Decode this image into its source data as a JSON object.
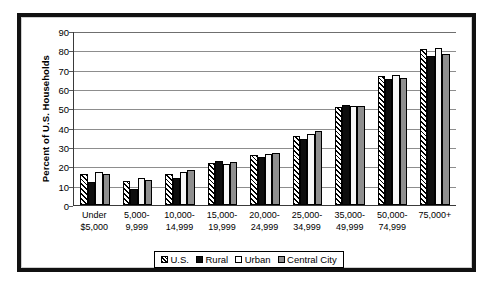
{
  "frame": {
    "border_color": "#111111",
    "background": "#ffffff"
  },
  "chart_data": {
    "type": "bar",
    "title": "",
    "xlabel": "",
    "ylabel": "Percent of U.S. Households",
    "ylim": [
      0,
      90
    ],
    "ytick_step": 10,
    "yticks": [
      "90",
      "80",
      "70",
      "60",
      "50",
      "40",
      "30",
      "20",
      "10",
      "0"
    ],
    "grid": true,
    "grid_axis": "y",
    "legend_position": "bottom-center",
    "categories": [
      "Under\n$5,000",
      "5,000-\n9,999",
      "10,000-\n14,999",
      "15,000-\n19,999",
      "20,000-\n24,999",
      "25,000-\n34,999",
      "35,000-\n49,999",
      "50,000-\n74,999",
      "75,000+"
    ],
    "category_lines": [
      [
        "Under",
        "$5,000"
      ],
      [
        "5,000-",
        "9,999"
      ],
      [
        "10,000-",
        "14,999"
      ],
      [
        "15,000-",
        "19,999"
      ],
      [
        "20,000-",
        "24,999"
      ],
      [
        "25,000-",
        "34,999"
      ],
      [
        "35,000-",
        "49,999"
      ],
      [
        "50,000-",
        "74,999"
      ],
      [
        "75,000+",
        ""
      ]
    ],
    "series": [
      {
        "name": "U.S.",
        "style": "diagonal-hatch",
        "color": "#ffffff",
        "values": [
          15.8,
          12.5,
          16.0,
          21.5,
          26.0,
          35.5,
          50.8,
          66.5,
          80.5
        ]
      },
      {
        "name": "Rural",
        "style": "solid-black",
        "color": "#0d0d0d",
        "values": [
          12.0,
          8.5,
          14.2,
          22.6,
          25.0,
          34.0,
          51.5,
          65.0,
          77.2
        ]
      },
      {
        "name": "Urban",
        "style": "solid-white",
        "color": "#f7f7f7",
        "values": [
          17.0,
          14.0,
          17.0,
          21.2,
          26.5,
          36.5,
          51.2,
          67.5,
          81.0
        ]
      },
      {
        "name": "Central City",
        "style": "solid-gray",
        "color": "#8f8f8f",
        "values": [
          16.0,
          13.0,
          18.2,
          22.2,
          27.0,
          38.3,
          51.0,
          65.5,
          78.0
        ]
      }
    ]
  },
  "legend": {
    "items": [
      {
        "label": "U.S.",
        "swatch": "s-us"
      },
      {
        "label": "Rural",
        "swatch": "s-rural"
      },
      {
        "label": "Urban",
        "swatch": "s-urban"
      },
      {
        "label": "Central City",
        "swatch": "s-central"
      }
    ]
  }
}
